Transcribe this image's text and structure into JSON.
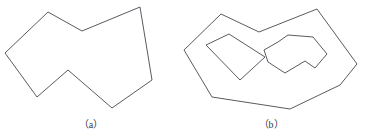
{
  "figure": {
    "background_color": "#ffffff",
    "stroke_color": "#5a5a62",
    "stroke_width": 1,
    "width": 365,
    "height": 136
  },
  "captions": {
    "a": "（a）",
    "b": "（b）"
  },
  "chart_data": {
    "type": "diagram",
    "title": "",
    "subtitle": "",
    "xlabel": "",
    "ylabel": "",
    "grid": false,
    "legend": false,
    "shapes": [
      {
        "id": "polygon-a",
        "label": "（a）",
        "role": "simple-polygon",
        "closed": true,
        "filled": false,
        "vertex_count": 8,
        "points": [
          [
            5,
            53
          ],
          [
            48,
            12
          ],
          [
            82,
            31
          ],
          [
            140,
            7
          ],
          [
            152,
            80
          ],
          [
            112,
            108
          ],
          [
            68,
            70
          ],
          [
            37,
            97
          ]
        ]
      },
      {
        "id": "polygon-b-outer",
        "label": "（b）",
        "role": "outer-boundary",
        "closed": true,
        "filled": false,
        "vertex_count": 8,
        "points": [
          [
            184,
            50
          ],
          [
            221,
            14
          ],
          [
            259,
            32
          ],
          [
            317,
            9
          ],
          [
            357,
            64
          ],
          [
            340,
            85
          ],
          [
            290,
            109
          ],
          [
            212,
            97
          ]
        ]
      },
      {
        "id": "polygon-b-hole-left",
        "label": "",
        "role": "hole",
        "closed": true,
        "filled": false,
        "vertex_count": 4,
        "points": [
          [
            206,
            45
          ],
          [
            229,
            34
          ],
          [
            265,
            57
          ],
          [
            240,
            80
          ]
        ]
      },
      {
        "id": "polygon-b-hole-right",
        "label": "",
        "role": "hole",
        "closed": true,
        "filled": false,
        "vertex_count": 9,
        "points": [
          [
            264,
            50
          ],
          [
            278,
            42
          ],
          [
            288,
            35
          ],
          [
            313,
            37
          ],
          [
            327,
            54
          ],
          [
            315,
            68
          ],
          [
            305,
            61
          ],
          [
            285,
            73
          ],
          [
            268,
            62
          ]
        ]
      }
    ]
  }
}
